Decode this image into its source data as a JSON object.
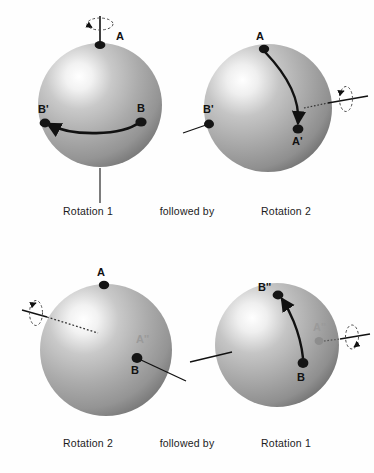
{
  "figure": {
    "background_color": "#fefefe",
    "sphere_fill_light": "#ffffff",
    "sphere_fill_mid": "#a8a8a8",
    "sphere_fill_dark": "#6f6f6f",
    "ink_color": "#111111",
    "ghost_color": "#9a9a9a"
  },
  "captions": {
    "top": {
      "left_label": "Rotation 1",
      "connector": "followed by",
      "right_label": "Rotation 2"
    },
    "bottom": {
      "left_label": "Rotation 2",
      "connector": "followed by",
      "right_label": "Rotation 1"
    }
  },
  "panels": [
    {
      "id": "top-left",
      "name": "sphere-rotation-1-initial",
      "caption": "Rotation 1",
      "axis": {
        "orientation": "vertical",
        "spin_marker": "dashed-ellipse-arrow"
      },
      "points": [
        {
          "name": "A",
          "label": "A",
          "style": "solid",
          "position": "north-pole"
        },
        {
          "name": "B",
          "label": "B",
          "style": "solid",
          "position": "equator-right"
        },
        {
          "name": "B-prime",
          "label": "B'",
          "style": "solid",
          "position": "equator-left"
        }
      ],
      "arc": {
        "from": "B",
        "to": "B'",
        "arrowhead_at": "B'"
      }
    },
    {
      "id": "top-right",
      "name": "sphere-rotation-2-applied",
      "caption": "Rotation 2",
      "axis": {
        "orientation": "horizontal",
        "spin_marker": "dashed-ellipse-arrow"
      },
      "points": [
        {
          "name": "A",
          "label": "A",
          "style": "solid",
          "position": "north-pole"
        },
        {
          "name": "A-prime",
          "label": "A'",
          "style": "solid",
          "position": "front-lower-right"
        },
        {
          "name": "B-prime",
          "label": "B'",
          "style": "solid",
          "position": "equator-left"
        }
      ],
      "arc": {
        "from": "A",
        "to": "A-prime",
        "arrowhead_at": "A-prime"
      }
    },
    {
      "id": "bottom-left",
      "name": "sphere-rotation-2-initial",
      "caption": "Rotation 2",
      "axis": {
        "orientation": "oblique",
        "spin_marker": "dashed-ellipse-arrow"
      },
      "points": [
        {
          "name": "A",
          "label": "A",
          "style": "solid",
          "position": "north-pole"
        },
        {
          "name": "A-double-prime",
          "label": "A''",
          "style": "ghost",
          "position": "right-of-center"
        },
        {
          "name": "B",
          "label": "B",
          "style": "solid",
          "position": "lower-right"
        }
      ],
      "arc": null
    },
    {
      "id": "bottom-right",
      "name": "sphere-rotation-1-applied",
      "caption": "Rotation 1",
      "axis": {
        "orientation": "horizontal",
        "spin_marker": "dashed-ellipse-arrow"
      },
      "points": [
        {
          "name": "B-double-prime",
          "label": "B''",
          "style": "solid",
          "position": "upper-left"
        },
        {
          "name": "B",
          "label": "B",
          "style": "solid",
          "position": "lower-center"
        },
        {
          "name": "A-double-prime",
          "label": "A''",
          "style": "ghost",
          "position": "right-of-center"
        }
      ],
      "arc": {
        "from": "B",
        "to": "B-double-prime",
        "arrowhead_at": "B-double-prime"
      }
    }
  ]
}
